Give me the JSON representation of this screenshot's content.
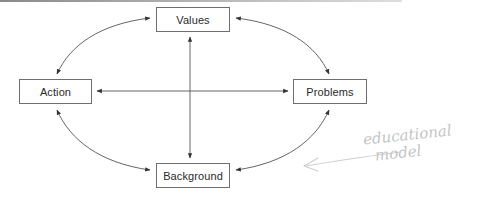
{
  "diagram": {
    "type": "educational-model-cycle",
    "nodes": [
      {
        "id": "values",
        "label": "Values",
        "position": "top"
      },
      {
        "id": "action",
        "label": "Action",
        "position": "left"
      },
      {
        "id": "problems",
        "label": "Problems",
        "position": "right"
      },
      {
        "id": "background",
        "label": "Background",
        "position": "bottom"
      }
    ],
    "edges": [
      {
        "from": "values",
        "to": "action",
        "style": "curved",
        "direction": "bidirectional"
      },
      {
        "from": "values",
        "to": "problems",
        "style": "curved",
        "direction": "bidirectional"
      },
      {
        "from": "action",
        "to": "background",
        "style": "curved",
        "direction": "bidirectional"
      },
      {
        "from": "problems",
        "to": "background",
        "style": "curved",
        "direction": "bidirectional"
      },
      {
        "from": "values",
        "to": "background",
        "style": "straight",
        "direction": "bidirectional"
      },
      {
        "from": "action",
        "to": "problems",
        "style": "straight",
        "direction": "bidirectional"
      }
    ],
    "annotation": {
      "line1": "educational",
      "line2": "model",
      "style": "handwritten-pencil",
      "points_to": "diagram"
    },
    "colors": {
      "line": "#555555",
      "box_border": "#6e6e6e",
      "text": "#2a2a2a",
      "annotation": "#c4c4c4"
    }
  }
}
